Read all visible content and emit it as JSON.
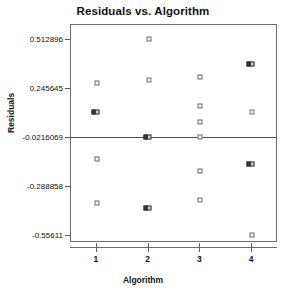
{
  "chart_data": {
    "type": "scatter",
    "title": "Residuals vs. Algorithm",
    "xlabel": "Algorithm",
    "ylabel": "Residuals",
    "grid": false,
    "legend": "none",
    "xlim": [
      0.5,
      4.5
    ],
    "ylim": [
      -0.6,
      0.59
    ],
    "x_ticks": [
      "1",
      "2",
      "3",
      "4"
    ],
    "x_tick_values": [
      1,
      2,
      3,
      4
    ],
    "y_ticks": [
      "0.512896",
      "0.245645",
      "-0.0216069",
      "-0.288858",
      "-0.55611"
    ],
    "y_tick_values": [
      0.512896,
      0.245645,
      -0.0216069,
      -0.288858,
      -0.55611
    ],
    "reference_line": -0.0216069,
    "categories": [
      "1",
      "2",
      "3",
      "4"
    ],
    "points": [
      {
        "x": 1,
        "y": 0.272,
        "overlap": false
      },
      {
        "x": 1,
        "y": 0.1155,
        "overlap": true
      },
      {
        "x": 1,
        "y": -0.1431,
        "overlap": false
      },
      {
        "x": 1,
        "y": -0.3802,
        "overlap": false
      },
      {
        "x": 2,
        "y": 0.5129,
        "overlap": false
      },
      {
        "x": 2,
        "y": 0.2918,
        "overlap": false
      },
      {
        "x": 2,
        "y": -0.0216,
        "overlap": true
      },
      {
        "x": 2,
        "y": -0.4066,
        "overlap": true
      },
      {
        "x": 3,
        "y": 0.305,
        "overlap": false
      },
      {
        "x": 3,
        "y": 0.1484,
        "overlap": false
      },
      {
        "x": 3,
        "y": 0.063,
        "overlap": false
      },
      {
        "x": 3,
        "y": -0.0216,
        "overlap": false
      },
      {
        "x": 3,
        "y": -0.2048,
        "overlap": false
      },
      {
        "x": 3,
        "y": -0.367,
        "overlap": false
      },
      {
        "x": 4,
        "y": 0.3776,
        "overlap": true
      },
      {
        "x": 4,
        "y": 0.1155,
        "overlap": false
      },
      {
        "x": 4,
        "y": -0.1694,
        "overlap": true
      },
      {
        "x": 4,
        "y": -0.5561,
        "overlap": false
      }
    ]
  }
}
